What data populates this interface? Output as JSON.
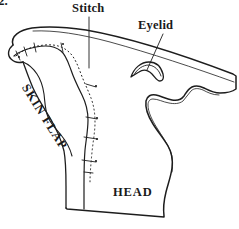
{
  "figure": {
    "number": "2.",
    "background_color": "#ffffff",
    "ink_color": "#1d1d1d",
    "width": 239,
    "height": 229
  },
  "labels": {
    "stitch": "Stitch",
    "eyelid": "Eyelid",
    "skin_flap": "SKIN FLAP",
    "head": "HEAD"
  },
  "regions": [
    {
      "name": "head",
      "label": "HEAD"
    },
    {
      "name": "skin-flap",
      "label": "SKIN FLAP"
    }
  ],
  "annotations": [
    {
      "name": "stitch",
      "label": "Stitch",
      "leader": "vertical"
    },
    {
      "name": "eyelid",
      "label": "Eyelid",
      "leader": "diagonal"
    }
  ],
  "features": {
    "eyelid_shape": "crescent",
    "stitch_line_style": "dotted-with-tick-marks",
    "stitch_mark_count": 9
  }
}
